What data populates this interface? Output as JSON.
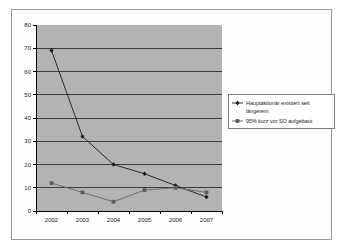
{
  "chart_data": {
    "type": "line",
    "title": "",
    "xlabel": "",
    "ylabel": "",
    "categories": [
      "2002",
      "2003",
      "2004",
      "2005",
      "2006",
      "2007"
    ],
    "ylim": [
      0,
      80
    ],
    "ytick_step": 10,
    "yticks": [
      "0",
      "10",
      "20",
      "30",
      "40",
      "50",
      "60",
      "70",
      "80"
    ],
    "grid": true,
    "legend_position": "right",
    "plot_background": "#b3b3b3",
    "series": [
      {
        "name": "Hauptaktionär existiert seit längerem",
        "marker": "diamond",
        "color": "#2b2b2b",
        "values": [
          69,
          32,
          20,
          16,
          11,
          6
        ]
      },
      {
        "name": "95% kurz vor SO aufgebaut",
        "marker": "square",
        "color": "#6d6d6d",
        "values": [
          12,
          8,
          4,
          9,
          10,
          8
        ]
      }
    ]
  },
  "legend": {
    "entries": [
      {
        "line1": "Hauptaktionär existiert seit",
        "line2": "längerem"
      },
      {
        "line1": "95% kurz vor SO aufgebaut",
        "line2": ""
      }
    ]
  },
  "axis": {
    "y_labels": [
      "80",
      "70",
      "60",
      "50",
      "40",
      "30",
      "20",
      "10",
      "0"
    ],
    "x_labels": [
      "2002",
      "2003",
      "2004",
      "2005",
      "2006",
      "2007"
    ]
  }
}
